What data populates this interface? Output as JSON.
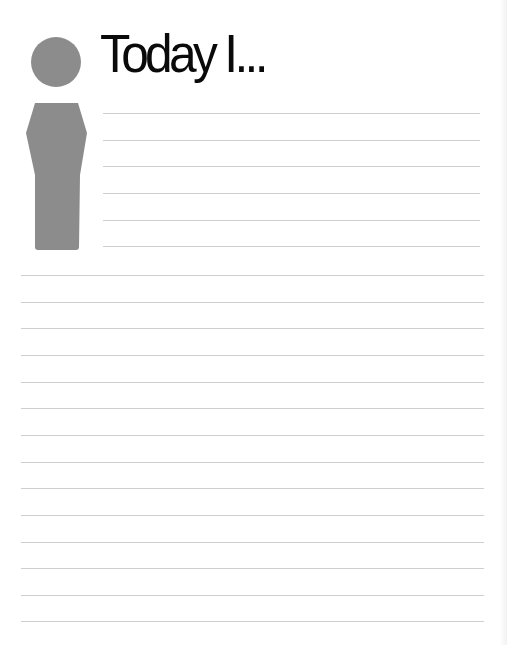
{
  "page": {
    "title": "Today I...",
    "icon": "info-person-icon",
    "colors": {
      "icon": "#8c8c8c",
      "rule": "#cfcfcf",
      "title": "#0a0a0a"
    },
    "short_rule_count": 6,
    "full_rule_count": 14
  }
}
